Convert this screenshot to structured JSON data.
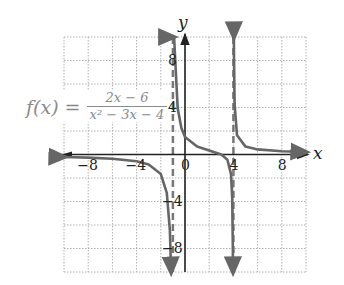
{
  "chart_data": {
    "type": "line",
    "title": "",
    "function_label": {
      "lhs": "f(x) =",
      "numerator": "2x − 6",
      "denominator": "x² − 3x − 4"
    },
    "xlabel": "x",
    "ylabel": "y",
    "xlim": [
      -10,
      10
    ],
    "ylim": [
      -10,
      10
    ],
    "grid": true,
    "grid_step": 2,
    "x_ticks": [
      "−8",
      "−4",
      "0",
      "4",
      "8"
    ],
    "y_ticks": [
      "8",
      "4",
      "−4",
      "−8"
    ],
    "vertical_asymptotes": [
      -1,
      4
    ],
    "horizontal_asymptote": 0,
    "series": [
      {
        "name": "f(x) branch x<-1",
        "x": [
          -10,
          -8,
          -6,
          -4,
          -3,
          -2,
          -1.5,
          -1.25,
          -1.15
        ],
        "y": [
          -0.21,
          -0.26,
          -0.36,
          -0.58,
          -0.86,
          -1.67,
          -3.27,
          -6.48,
          -10
        ]
      },
      {
        "name": "f(x) branch -1<x<4",
        "x": [
          -0.93,
          -0.9,
          -0.8,
          -0.6,
          -0.3,
          0,
          1,
          2,
          3,
          3.5,
          3.8,
          3.9,
          3.95,
          3.97
        ],
        "y": [
          10,
          15.9,
          7.92,
          3.91,
          2.25,
          1.5,
          0.67,
          0.33,
          0,
          -0.44,
          -1.67,
          -3.67,
          -7.68,
          -10
        ]
      },
      {
        "name": "f(x) branch x>4",
        "x": [
          4.04,
          4.05,
          4.1,
          4.3,
          5,
          6,
          8,
          10
        ],
        "y": [
          10,
          8.32,
          4.31,
          1.64,
          0.67,
          0.43,
          0.28,
          0.21
        ]
      }
    ],
    "colors": {
      "curve": "#666666",
      "asymptote": "#777777",
      "axis": "#222222",
      "grid": "#b0b0b0",
      "formula_text": "#8a8a8a"
    }
  }
}
